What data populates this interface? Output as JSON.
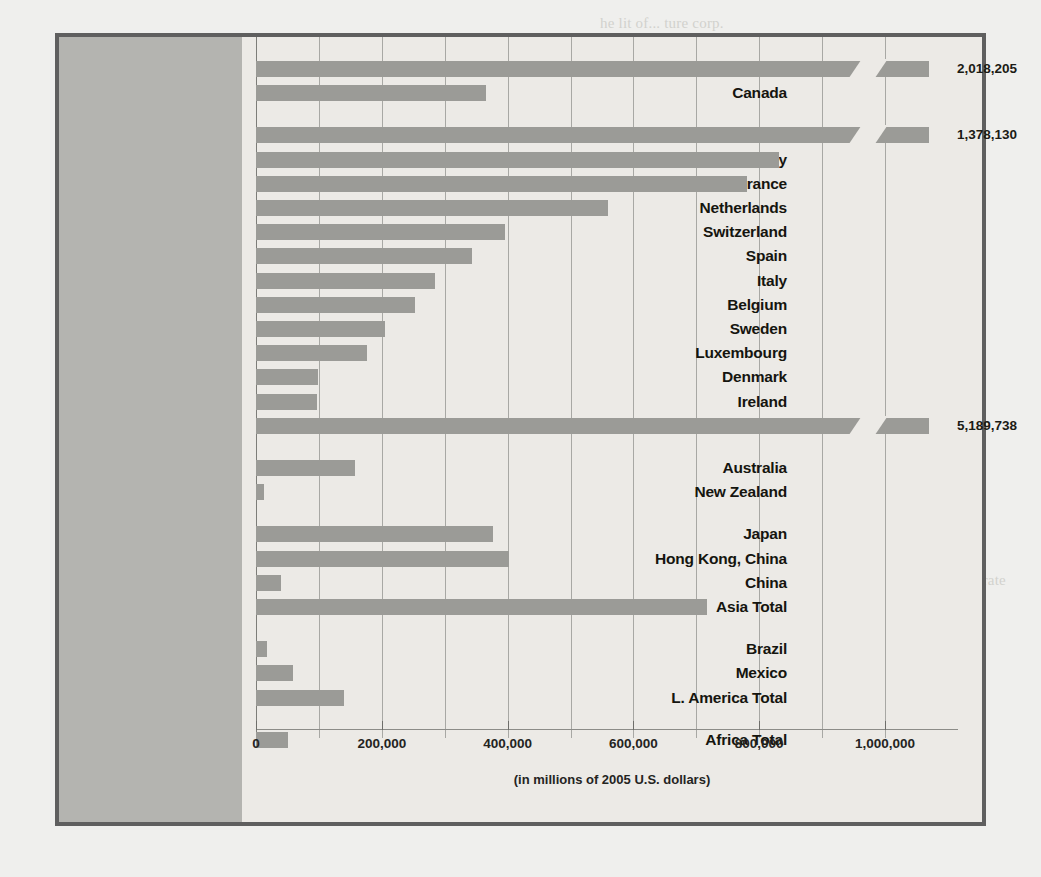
{
  "figure": {
    "axis_caption": "(in millions of 2005 U.S. dollars)",
    "bar_color": "#9b9b97",
    "panel_color": "#b4b4b0",
    "plot_bg": "#eceae6",
    "frame_color": "#5f5f5f"
  },
  "ghost_text": "he lit of... ture corp.\n\n\nna  the  l of  gar  ee  sel  es\nti  mea  ar  ne  thi  acc  ve of  ent\nnegotiation. The  revenue  of  a  st  ct\nwill  not  be  sub  to  its  nati  ts  or\ninvestment  facilities,  managing  all\nfunds  flowing  from  that  for  ce  wh  th\nreceiving  the  exact  in  es  a  ne  it  ity\nwill  then  have  to  repay  the  s  al  amount\nthe  investment  of  the  or  ic  fa  ic  ty.\n\nIn  another  case,  a  country  may  pro  ts  in  d\nMarkets  in  the  variable  terms  of  dea  d  abr  ion\nways  of  the  production  the  index  fa  ity  ity\nA  great  in  20  the  ta  will  know  bas  by  ons\nthat  direction  inves  or  res  is  ic  th  in  ny.\nthe  corporate  press  but  by  the  de  1  ind  re  ad  in  go\nU.S.  dependent  invest  wo  fra  the  ind  for  and  the  for\ndemands  of  the  new  econo  in  or  the  gl  of  the  inf\nmaterials  can  follow  the  sa  ofs  fir  an  from  la  gov  hast  rate\nthe  last  ten  yea  has  been  in  the  gl  of  dema  and\n\nthe  production  and  the  go.  Th  of  hi  go  cor  ra  tions\n\nthe  en  up  to  the  pro  the  wh  nat  in  str  e  ve  ral\nthe  econ  of  that  was  in  and  the  for  in  co  on",
  "chart_data": {
    "type": "bar",
    "orientation": "horizontal",
    "title": "",
    "xlabel": "(in millions of 2005 U.S. dollars)",
    "ylabel": "",
    "xlim": [
      0,
      1100000
    ],
    "xticks": [
      0,
      200000,
      400000,
      600000,
      800000,
      1000000
    ],
    "xtick_labels": [
      "0",
      "200,000",
      "400,000",
      "600,000",
      "800,000",
      "1,000,000"
    ],
    "minor_gridlines": [
      100000,
      300000,
      500000,
      700000,
      900000
    ],
    "grid": true,
    "legend": "none",
    "axis_break_note": "Bars exceeding the axis maximum are drawn with a diagonal break and labeled with their true value.",
    "rows": [
      {
        "label": "United States",
        "value": 2018205,
        "display": "2,018,205",
        "plotted": 1070000,
        "broken": true,
        "gap_before": 0
      },
      {
        "label": "Canada",
        "value": 365000,
        "display": "",
        "plotted": 365000,
        "broken": false,
        "gap_before": 0
      },
      {
        "label": "United Kingdom",
        "value": 1378130,
        "display": "1,378,130",
        "plotted": 1070000,
        "broken": true,
        "gap_before": 1
      },
      {
        "label": "Germany",
        "value": 832000,
        "display": "",
        "plotted": 832000,
        "broken": false,
        "gap_before": 0
      },
      {
        "label": "France",
        "value": 780000,
        "display": "",
        "plotted": 780000,
        "broken": false,
        "gap_before": 0
      },
      {
        "label": "Netherlands",
        "value": 559000,
        "display": "",
        "plotted": 559000,
        "broken": false,
        "gap_before": 0
      },
      {
        "label": "Switzerland",
        "value": 396000,
        "display": "",
        "plotted": 396000,
        "broken": false,
        "gap_before": 0
      },
      {
        "label": "Spain",
        "value": 343000,
        "display": "",
        "plotted": 343000,
        "broken": false,
        "gap_before": 0
      },
      {
        "label": "Italy",
        "value": 284000,
        "display": "",
        "plotted": 284000,
        "broken": false,
        "gap_before": 0
      },
      {
        "label": "Belgium",
        "value": 252000,
        "display": "",
        "plotted": 252000,
        "broken": false,
        "gap_before": 0
      },
      {
        "label": "Sweden",
        "value": 205000,
        "display": "",
        "plotted": 205000,
        "broken": false,
        "gap_before": 0
      },
      {
        "label": "Luxembourg",
        "value": 176000,
        "display": "",
        "plotted": 176000,
        "broken": false,
        "gap_before": 0
      },
      {
        "label": "Denmark",
        "value": 99000,
        "display": "",
        "plotted": 99000,
        "broken": false,
        "gap_before": 0
      },
      {
        "label": "Ireland",
        "value": 97000,
        "display": "",
        "plotted": 97000,
        "broken": false,
        "gap_before": 0
      },
      {
        "label": "EU Total",
        "value": 5189738,
        "display": "5,189,738",
        "plotted": 1070000,
        "broken": true,
        "gap_before": 0
      },
      {
        "label": "Australia",
        "value": 157000,
        "display": "",
        "plotted": 157000,
        "broken": false,
        "gap_before": 1
      },
      {
        "label": "New Zealand",
        "value": 12000,
        "display": "",
        "plotted": 12000,
        "broken": false,
        "gap_before": 0
      },
      {
        "label": "Japan",
        "value": 376000,
        "display": "",
        "plotted": 376000,
        "broken": false,
        "gap_before": 1
      },
      {
        "label": "Hong Kong, China",
        "value": 403000,
        "display": "",
        "plotted": 403000,
        "broken": false,
        "gap_before": 0
      },
      {
        "label": "China",
        "value": 40000,
        "display": "",
        "plotted": 40000,
        "broken": false,
        "gap_before": 0
      },
      {
        "label": "Asia Total",
        "value": 717000,
        "display": "",
        "plotted": 717000,
        "broken": false,
        "gap_before": 0
      },
      {
        "label": "Brazil",
        "value": 18000,
        "display": "",
        "plotted": 18000,
        "broken": false,
        "gap_before": 1
      },
      {
        "label": "Mexico",
        "value": 59000,
        "display": "",
        "plotted": 59000,
        "broken": false,
        "gap_before": 0
      },
      {
        "label": "L. America Total",
        "value": 140000,
        "display": "",
        "plotted": 140000,
        "broken": false,
        "gap_before": 0
      },
      {
        "label": "Africa Total",
        "value": 51000,
        "display": "",
        "plotted": 51000,
        "broken": false,
        "gap_before": 1
      }
    ]
  }
}
